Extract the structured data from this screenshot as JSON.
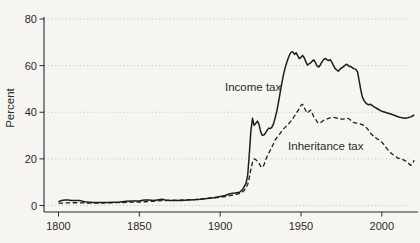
{
  "figure": {
    "type_label": "line-chart",
    "colors": {
      "background": "#f6f5f2",
      "line": "#1c1c1c",
      "grid": "#bcbab6",
      "axis": "#2a2a2a",
      "text": "#2a2a2a"
    }
  },
  "chart_data": {
    "type": "line",
    "title": "",
    "xlabel": "",
    "ylabel": "Percent",
    "xlim": [
      1800,
      2022
    ],
    "ylim": [
      0,
      80
    ],
    "x_ticks": [
      1800,
      1850,
      1900,
      1950,
      2000
    ],
    "y_ticks": [
      0,
      20,
      40,
      60,
      80
    ],
    "grid": "horizontal-dotted",
    "legend_position": "inline-annotations",
    "annotations": [
      {
        "id": "income-tax-label",
        "text": "Income tax",
        "year": 1903,
        "value": 49.2
      },
      {
        "id": "inheritance-tax-label",
        "text": "Inheritance tax",
        "year": 1942,
        "value": 23.8
      }
    ],
    "series": [
      {
        "name": "Income tax",
        "style": "solid",
        "points": [
          [
            1800,
            1.6
          ],
          [
            1802,
            2.2
          ],
          [
            1804,
            2.3
          ],
          [
            1806,
            2.3
          ],
          [
            1808,
            2.2
          ],
          [
            1810,
            2.1
          ],
          [
            1813,
            2.2
          ],
          [
            1816,
            1.6
          ],
          [
            1819,
            1.4
          ],
          [
            1822,
            1.3
          ],
          [
            1826,
            1.3
          ],
          [
            1830,
            1.3
          ],
          [
            1834,
            1.4
          ],
          [
            1838,
            1.5
          ],
          [
            1842,
            1.8
          ],
          [
            1846,
            1.9
          ],
          [
            1850,
            1.9
          ],
          [
            1853,
            2.4
          ],
          [
            1856,
            2.4
          ],
          [
            1859,
            2.1
          ],
          [
            1862,
            2.5
          ],
          [
            1864,
            2.7
          ],
          [
            1866,
            2.4
          ],
          [
            1869,
            2.2
          ],
          [
            1872,
            2.2
          ],
          [
            1876,
            2.2
          ],
          [
            1880,
            2.3
          ],
          [
            1884,
            2.5
          ],
          [
            1888,
            2.7
          ],
          [
            1892,
            3.0
          ],
          [
            1896,
            3.3
          ],
          [
            1900,
            3.8
          ],
          [
            1903,
            4.3
          ],
          [
            1906,
            5.0
          ],
          [
            1909,
            5.3
          ],
          [
            1912,
            5.7
          ],
          [
            1914,
            7.0
          ],
          [
            1916,
            9.5
          ],
          [
            1917,
            13
          ],
          [
            1918,
            22
          ],
          [
            1919,
            32
          ],
          [
            1920,
            37.4
          ],
          [
            1921,
            34.4
          ],
          [
            1922,
            35.2
          ],
          [
            1923,
            36.2
          ],
          [
            1924,
            34.8
          ],
          [
            1925,
            31.8
          ],
          [
            1926,
            30.1
          ],
          [
            1927,
            30.2
          ],
          [
            1928,
            31.0
          ],
          [
            1929,
            32.2
          ],
          [
            1930,
            33.2
          ],
          [
            1931,
            33.0
          ],
          [
            1932,
            33.6
          ],
          [
            1933,
            35.0
          ],
          [
            1934,
            37.5
          ],
          [
            1935,
            40.5
          ],
          [
            1936,
            44
          ],
          [
            1937,
            48
          ],
          [
            1938,
            52
          ],
          [
            1939,
            55.5
          ],
          [
            1940,
            58.5
          ],
          [
            1941,
            61
          ],
          [
            1942,
            63
          ],
          [
            1943,
            64.8
          ],
          [
            1944,
            65.8
          ],
          [
            1945,
            65.9
          ],
          [
            1946,
            64.8
          ],
          [
            1947,
            65.5
          ],
          [
            1948,
            64.2
          ],
          [
            1949,
            63.0
          ],
          [
            1950,
            63.6
          ],
          [
            1951,
            64.4
          ],
          [
            1952,
            63.4
          ],
          [
            1953,
            61.6
          ],
          [
            1954,
            60.2
          ],
          [
            1955,
            60.8
          ],
          [
            1956,
            61.2
          ],
          [
            1957,
            62.0
          ],
          [
            1958,
            62.4
          ],
          [
            1959,
            61.2
          ],
          [
            1960,
            59.8
          ],
          [
            1961,
            59.4
          ],
          [
            1962,
            60.4
          ],
          [
            1963,
            61.6
          ],
          [
            1964,
            62.6
          ],
          [
            1965,
            63.1
          ],
          [
            1966,
            62.6
          ],
          [
            1967,
            62.1
          ],
          [
            1968,
            62.6
          ],
          [
            1969,
            61.6
          ],
          [
            1970,
            60.2
          ],
          [
            1971,
            58.8
          ],
          [
            1972,
            58.2
          ],
          [
            1973,
            57.6
          ],
          [
            1974,
            58.4
          ],
          [
            1975,
            59.0
          ],
          [
            1976,
            59.4
          ],
          [
            1977,
            60.0
          ],
          [
            1978,
            60.6
          ],
          [
            1979,
            60.2
          ],
          [
            1980,
            59.6
          ],
          [
            1981,
            59.6
          ],
          [
            1982,
            59.0
          ],
          [
            1983,
            58.6
          ],
          [
            1984,
            58.4
          ],
          [
            1985,
            57.2
          ],
          [
            1986,
            53.5
          ],
          [
            1987,
            49.5
          ],
          [
            1988,
            46.5
          ],
          [
            1989,
            45.0
          ],
          [
            1990,
            44.0
          ],
          [
            1991,
            43.4
          ],
          [
            1992,
            43.2
          ],
          [
            1993,
            43.4
          ],
          [
            1994,
            43.0
          ],
          [
            1995,
            42.4
          ],
          [
            1996,
            42.0
          ],
          [
            1997,
            41.6
          ],
          [
            1998,
            41.2
          ],
          [
            1999,
            40.8
          ],
          [
            2000,
            40.4
          ],
          [
            2002,
            40.0
          ],
          [
            2004,
            39.6
          ],
          [
            2006,
            39.1
          ],
          [
            2008,
            38.6
          ],
          [
            2010,
            38.1
          ],
          [
            2012,
            37.7
          ],
          [
            2014,
            37.4
          ],
          [
            2016,
            37.6
          ],
          [
            2018,
            38.0
          ],
          [
            2020,
            38.8
          ]
        ]
      },
      {
        "name": "Inheritance tax",
        "style": "dashed",
        "points": [
          [
            1800,
            1.0
          ],
          [
            1805,
            1.1
          ],
          [
            1810,
            1.2
          ],
          [
            1815,
            1.1
          ],
          [
            1820,
            1.0
          ],
          [
            1825,
            1.0
          ],
          [
            1830,
            1.1
          ],
          [
            1835,
            1.2
          ],
          [
            1840,
            1.3
          ],
          [
            1845,
            1.4
          ],
          [
            1850,
            1.5
          ],
          [
            1855,
            1.7
          ],
          [
            1860,
            1.9
          ],
          [
            1865,
            2.1
          ],
          [
            1870,
            2.2
          ],
          [
            1875,
            2.3
          ],
          [
            1880,
            2.4
          ],
          [
            1885,
            2.6
          ],
          [
            1890,
            2.9
          ],
          [
            1894,
            3.2
          ],
          [
            1898,
            3.4
          ],
          [
            1902,
            3.7
          ],
          [
            1906,
            4.2
          ],
          [
            1910,
            4.8
          ],
          [
            1913,
            5.4
          ],
          [
            1915,
            6.5
          ],
          [
            1917,
            9.0
          ],
          [
            1918,
            12
          ],
          [
            1919,
            15.5
          ],
          [
            1920,
            18.5
          ],
          [
            1921,
            20.0
          ],
          [
            1922,
            19.7
          ],
          [
            1923,
            19.0
          ],
          [
            1924,
            18.2
          ],
          [
            1925,
            16.8
          ],
          [
            1926,
            16.3
          ],
          [
            1927,
            17.2
          ],
          [
            1928,
            19.3
          ],
          [
            1929,
            21.0
          ],
          [
            1930,
            22.4
          ],
          [
            1931,
            23.7
          ],
          [
            1932,
            25.1
          ],
          [
            1933,
            26.5
          ],
          [
            1934,
            28.0
          ],
          [
            1935,
            29.1
          ],
          [
            1936,
            30.0
          ],
          [
            1937,
            30.8
          ],
          [
            1938,
            31.8
          ],
          [
            1939,
            32.6
          ],
          [
            1940,
            33.4
          ],
          [
            1942,
            34.8
          ],
          [
            1944,
            36.4
          ],
          [
            1946,
            38.4
          ],
          [
            1947,
            39.4
          ],
          [
            1948,
            40.6
          ],
          [
            1949,
            41.6
          ],
          [
            1950,
            43.0
          ],
          [
            1951,
            43.4
          ],
          [
            1952,
            42.0
          ],
          [
            1953,
            40.6
          ],
          [
            1954,
            39.6
          ],
          [
            1955,
            40.4
          ],
          [
            1956,
            40.9
          ],
          [
            1957,
            39.4
          ],
          [
            1958,
            37.9
          ],
          [
            1959,
            37.0
          ],
          [
            1960,
            35.8
          ],
          [
            1961,
            35.2
          ],
          [
            1962,
            35.6
          ],
          [
            1963,
            36.0
          ],
          [
            1964,
            36.5
          ],
          [
            1965,
            36.9
          ],
          [
            1966,
            37.1
          ],
          [
            1967,
            37.4
          ],
          [
            1968,
            37.6
          ],
          [
            1969,
            37.7
          ],
          [
            1970,
            37.8
          ],
          [
            1971,
            37.7
          ],
          [
            1972,
            37.5
          ],
          [
            1973,
            37.4
          ],
          [
            1974,
            37.2
          ],
          [
            1975,
            37.0
          ],
          [
            1976,
            37.0
          ],
          [
            1977,
            37.2
          ],
          [
            1978,
            37.3
          ],
          [
            1979,
            37.4
          ],
          [
            1980,
            37.0
          ],
          [
            1981,
            36.4
          ],
          [
            1982,
            35.7
          ],
          [
            1983,
            35.5
          ],
          [
            1984,
            35.4
          ],
          [
            1985,
            35.3
          ],
          [
            1987,
            34.9
          ],
          [
            1989,
            34.4
          ],
          [
            1991,
            33.0
          ],
          [
            1993,
            31.0
          ],
          [
            1995,
            29.6
          ],
          [
            1997,
            28.6
          ],
          [
            1999,
            28.0
          ],
          [
            2000,
            27.2
          ],
          [
            2001,
            26.4
          ],
          [
            2002,
            25.4
          ],
          [
            2003,
            24.5
          ],
          [
            2004,
            23.7
          ],
          [
            2005,
            23.0
          ],
          [
            2006,
            22.3
          ],
          [
            2007,
            21.8
          ],
          [
            2008,
            21.4
          ],
          [
            2009,
            20.8
          ],
          [
            2010,
            20.3
          ],
          [
            2012,
            19.9
          ],
          [
            2014,
            19.4
          ],
          [
            2016,
            18.4
          ],
          [
            2017,
            17.8
          ],
          [
            2018,
            17.2
          ],
          [
            2019,
            18.0
          ],
          [
            2020,
            19.4
          ]
        ]
      }
    ]
  }
}
